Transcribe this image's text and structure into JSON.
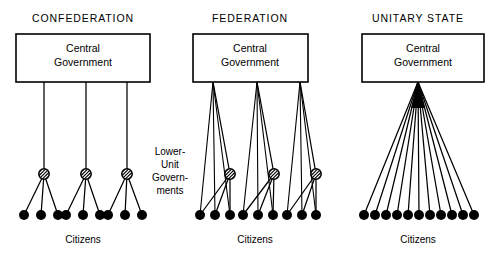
{
  "figure": {
    "background_color": "#ffffff",
    "ink_color": "#000000",
    "width": 502,
    "height": 254
  },
  "labels": {
    "central_government_line1": "Central",
    "central_government_line2": "Government",
    "citizens": "Citizens",
    "lower_unit_line1": "Lower-",
    "lower_unit_line2": "Unit",
    "lower_unit_line3": "Govern-",
    "lower_unit_line4": "ments"
  },
  "side_label": {
    "name": "lower-unit-governments",
    "x": 170,
    "lines": [
      {
        "text": "Lower-",
        "y": 155
      },
      {
        "text": "Unit",
        "y": 168
      },
      {
        "text": "Govern-",
        "y": 181
      },
      {
        "text": "ments",
        "y": 194
      }
    ]
  },
  "panels": [
    {
      "id": "confederation",
      "heading": "CONFEDERATION",
      "heading_x": 83,
      "heading_y": 22,
      "box": {
        "x": 16,
        "y": 34,
        "width": 134,
        "height": 48
      },
      "box_label_x": 83,
      "box_label_line1_y": 52,
      "box_label_line2_y": 66,
      "citizens_label_x": 83,
      "citizens_label_y": 243,
      "has_unit_nodes": true,
      "central_links_to_citizens": false,
      "unit_nodes": [
        {
          "x": 44,
          "y": 174,
          "r": 5.2,
          "stem_from_x": 44
        },
        {
          "x": 86,
          "y": 174,
          "r": 5.2,
          "stem_from_x": 86
        },
        {
          "x": 127,
          "y": 174,
          "r": 5.2,
          "stem_from_x": 127
        }
      ],
      "citizen_groups": [
        [
          {
            "x": 24,
            "y": 215
          },
          {
            "x": 41,
            "y": 215
          },
          {
            "x": 58,
            "y": 215
          }
        ],
        [
          {
            "x": 66,
            "y": 215
          },
          {
            "x": 83,
            "y": 215
          },
          {
            "x": 100,
            "y": 215
          }
        ],
        [
          {
            "x": 108,
            "y": 215
          },
          {
            "x": 125,
            "y": 215
          },
          {
            "x": 142,
            "y": 215
          }
        ]
      ],
      "citizen_radius": 5.0
    },
    {
      "id": "federation",
      "heading": "FEDERATION",
      "heading_x": 250,
      "heading_y": 22,
      "box": {
        "x": 193,
        "y": 34,
        "width": 115,
        "height": 48
      },
      "box_label_x": 250,
      "box_label_line1_y": 52,
      "box_label_line2_y": 66,
      "citizens_label_x": 255,
      "citizens_label_y": 243,
      "has_unit_nodes": true,
      "central_links_to_citizens": true,
      "unit_nodes": [
        {
          "x": 230,
          "y": 174,
          "r": 5.2,
          "stem_from_x": 213
        },
        {
          "x": 274,
          "y": 174,
          "r": 5.2,
          "stem_from_x": 257
        },
        {
          "x": 316,
          "y": 174,
          "r": 5.2,
          "stem_from_x": 300
        }
      ],
      "citizen_groups": [
        [
          {
            "x": 200,
            "y": 215
          },
          {
            "x": 215,
            "y": 215
          },
          {
            "x": 230,
            "y": 215
          }
        ],
        [
          {
            "x": 243,
            "y": 215
          },
          {
            "x": 258,
            "y": 215
          },
          {
            "x": 273,
            "y": 215
          }
        ],
        [
          {
            "x": 287,
            "y": 215
          },
          {
            "x": 302,
            "y": 215
          },
          {
            "x": 316,
            "y": 215
          }
        ]
      ],
      "citizen_radius": 5.0
    },
    {
      "id": "unitary-state",
      "heading": "UNITARY STATE",
      "heading_x": 418,
      "heading_y": 22,
      "box": {
        "x": 362,
        "y": 34,
        "width": 122,
        "height": 48
      },
      "box_label_x": 423,
      "box_label_line1_y": 52,
      "box_label_line2_y": 66,
      "citizens_label_x": 418,
      "citizens_label_y": 243,
      "has_unit_nodes": false,
      "central_links_to_citizens": true,
      "apex": {
        "x": 418,
        "y": 82
      },
      "unit_nodes": [],
      "citizen_groups": [
        [
          {
            "x": 364,
            "y": 215
          },
          {
            "x": 375,
            "y": 215
          },
          {
            "x": 386,
            "y": 215
          },
          {
            "x": 397,
            "y": 215
          },
          {
            "x": 408,
            "y": 215
          },
          {
            "x": 419,
            "y": 215
          },
          {
            "x": 430,
            "y": 215
          },
          {
            "x": 441,
            "y": 215
          },
          {
            "x": 452,
            "y": 215
          },
          {
            "x": 463,
            "y": 215
          },
          {
            "x": 474,
            "y": 215
          }
        ]
      ],
      "citizen_radius": 5.0
    }
  ]
}
